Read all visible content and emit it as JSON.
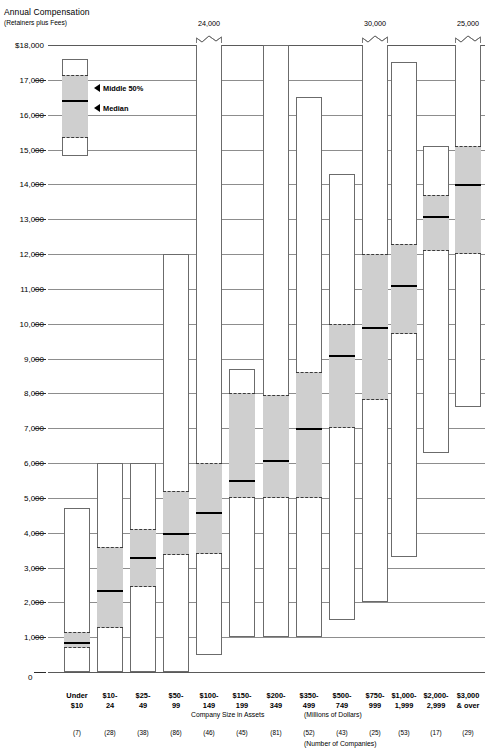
{
  "title": {
    "main": "Annual Compensation",
    "sub": "(Retainers plus Fees)"
  },
  "legend": {
    "middle_label": "Middle 50%",
    "median_label": "Median"
  },
  "axis": {
    "x_title": "Company Size in Assets",
    "x_units": "(Millions of Dollars)",
    "x_count_note": "(Number of Companies)",
    "zero_label": "0",
    "y_ticks": [
      "$18,000",
      "17,000",
      "16,000",
      "15,000",
      "14,000",
      "13,000",
      "12,000",
      "11,000",
      "10,000",
      "9,000",
      "8,000",
      "7,000",
      "6,000",
      "5,000",
      "4,000",
      "3,000",
      "2,000",
      "1,000"
    ]
  },
  "chart_data": {
    "type": "box",
    "title": "Annual Compensation (Retainers plus Fees)",
    "xlabel": "Company Size in Assets (Millions of Dollars)",
    "ylabel": "Annual Compensation",
    "ylim": [
      0,
      18000
    ],
    "grid": true,
    "legend_position": "inside-top-left",
    "y_ticks": [
      18000,
      17000,
      16000,
      15000,
      14000,
      13000,
      12000,
      11000,
      10000,
      9000,
      8000,
      7000,
      6000,
      5000,
      4000,
      3000,
      2000,
      1000,
      0
    ],
    "categories": [
      "Under $10",
      "$10-24",
      "$25-49",
      "$50-99",
      "$100-149",
      "$150-199",
      "$200-349",
      "$350-499",
      "$500-749",
      "$750-999",
      "$1,000-1,999",
      "$2,000-2,999",
      "$3,000 & over"
    ],
    "counts": [
      7,
      28,
      38,
      86,
      46,
      45,
      81,
      52,
      43,
      25,
      53,
      17,
      29
    ],
    "series": [
      {
        "category": "Under $10",
        "min": 0,
        "q1": 700,
        "median": 850,
        "q3": 1150,
        "max": 4700,
        "truncated_top": false,
        "top_label": null
      },
      {
        "category": "$10-24",
        "min": 0,
        "q1": 1250,
        "median": 2350,
        "q3": 3600,
        "max": 6000,
        "truncated_top": false,
        "top_label": null
      },
      {
        "category": "$25-49",
        "min": 0,
        "q1": 2450,
        "median": 3300,
        "q3": 4100,
        "max": 6000,
        "truncated_top": false,
        "top_label": null
      },
      {
        "category": "$50-99",
        "min": 0,
        "q1": 3350,
        "median": 4000,
        "q3": 5200,
        "max": 12000,
        "truncated_top": false,
        "top_label": null
      },
      {
        "category": "$100-149",
        "min": 500,
        "q1": 3400,
        "median": 4600,
        "q3": 6000,
        "max": 18000,
        "truncated_top": true,
        "top_label": "24,000"
      },
      {
        "category": "$150-199",
        "min": 1000,
        "q1": 5000,
        "median": 5500,
        "q3": 8000,
        "max": 8700,
        "truncated_top": false,
        "top_label": null
      },
      {
        "category": "$200-349",
        "min": 1000,
        "q1": 5000,
        "median": 6100,
        "q3": 7950,
        "max": 18000,
        "truncated_top": false,
        "top_label": null
      },
      {
        "category": "$350-499",
        "min": 1000,
        "q1": 5000,
        "median": 7000,
        "q3": 8600,
        "max": 16500,
        "truncated_top": false,
        "top_label": null
      },
      {
        "category": "$500-749",
        "min": 1500,
        "q1": 7000,
        "median": 9100,
        "q3": 10000,
        "max": 14300,
        "truncated_top": false,
        "top_label": null
      },
      {
        "category": "$750-999",
        "min": 2000,
        "q1": 7800,
        "median": 9900,
        "q3": 12000,
        "max": 18000,
        "truncated_top": true,
        "top_label": "30,000"
      },
      {
        "category": "$1,000-1,999",
        "min": 3300,
        "q1": 9700,
        "median": 11100,
        "q3": 12300,
        "max": 17500,
        "truncated_top": false,
        "top_label": null
      },
      {
        "category": "$2,000-2,999",
        "min": 6300,
        "q1": 12100,
        "median": 13100,
        "q3": 13700,
        "max": 15100,
        "truncated_top": false,
        "top_label": null
      },
      {
        "category": "$3,000 & over",
        "min": 7600,
        "q1": 12000,
        "median": 14000,
        "q3": 15100,
        "max": 18000,
        "truncated_top": true,
        "top_label": "25,000"
      }
    ]
  }
}
